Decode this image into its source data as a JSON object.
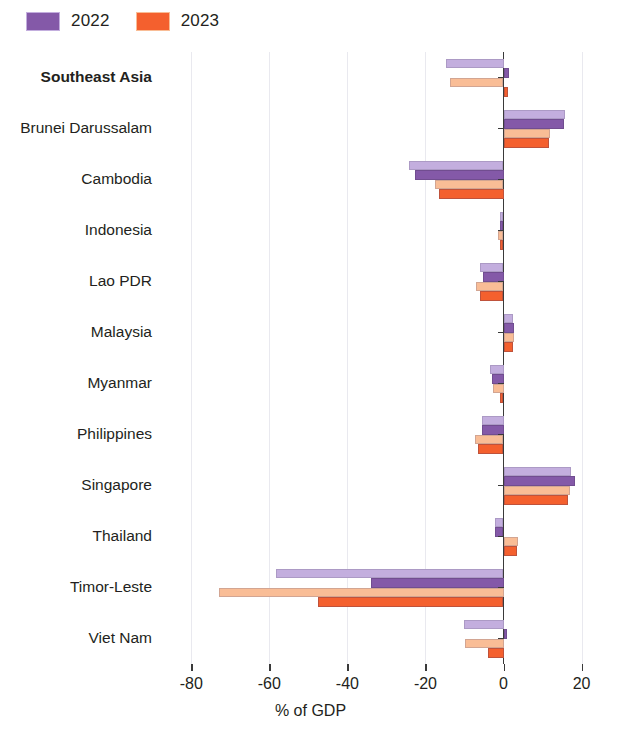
{
  "legend": {
    "items": [
      {
        "label": "2022",
        "color": "#8459a8",
        "light_color": "#c3aede",
        "name": "legend-2022"
      },
      {
        "label": "2023",
        "color": "#f4602e",
        "light_color": "#f9bd96",
        "name": "legend-2023"
      }
    ]
  },
  "axis": {
    "x_title": "% of GDP",
    "ticks": [
      {
        "value": -80,
        "label": "-80"
      },
      {
        "value": -60,
        "label": "-60"
      },
      {
        "value": -40,
        "label": "-40"
      },
      {
        "value": -20,
        "label": "-20"
      },
      {
        "value": 0,
        "label": "0"
      },
      {
        "value": 20,
        "label": "20"
      }
    ],
    "min": -88,
    "max": 26
  },
  "chart_data": {
    "type": "bar",
    "orientation": "horizontal",
    "title": "",
    "xlabel": "% of GDP",
    "ylabel": "",
    "xlim": [
      -88,
      26
    ],
    "grid": true,
    "legend_position": "top-left",
    "categories": [
      "Southeast Asia",
      "Brunei Darussalam",
      "Cambodia",
      "Indonesia",
      "Lao PDR",
      "Malaysia",
      "Myanmar",
      "Philippines",
      "Singapore",
      "Thailand",
      "Timor-Leste",
      "Viet Nam"
    ],
    "highlight_category": "Southeast Asia",
    "series": [
      {
        "name": "2022",
        "shade": "light",
        "color": "#c3aede",
        "values": [
          -14.8,
          15.8,
          -24.2,
          -1.0,
          -6.0,
          2.4,
          -3.4,
          -5.6,
          17.2,
          -2.2,
          -58.3,
          -10.2
        ],
        "note": "light outer bar, 2022"
      },
      {
        "name": "2022",
        "shade": "dark",
        "color": "#8459a8",
        "values": [
          1.4,
          15.6,
          -22.6,
          -0.8,
          -5.2,
          2.6,
          -3.0,
          -5.6,
          18.2,
          -2.2,
          -34.0,
          0.8
        ],
        "note": "dark inner bar, 2022"
      },
      {
        "name": "2023",
        "shade": "light",
        "color": "#f9bd96",
        "values": [
          -13.8,
          11.8,
          -17.6,
          -1.4,
          -7.0,
          2.6,
          -2.6,
          -7.2,
          17.0,
          3.6,
          -73.0,
          -9.8
        ],
        "note": "light outer bar, 2023"
      },
      {
        "name": "2023",
        "shade": "dark",
        "color": "#f4602e",
        "values": [
          1.2,
          11.6,
          -16.4,
          -1.0,
          -6.0,
          2.4,
          -0.8,
          -6.6,
          16.6,
          3.4,
          -47.4,
          -4.0
        ],
        "note": "dark inner bar, 2023"
      }
    ]
  }
}
